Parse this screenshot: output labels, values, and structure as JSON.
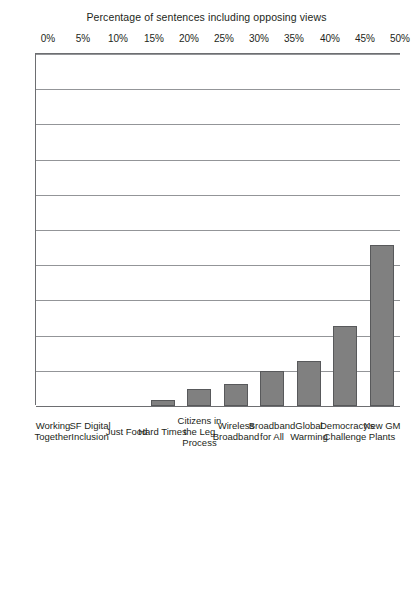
{
  "chart_data": {
    "type": "bar",
    "orientation": "horizontal",
    "title": "",
    "xlabel": "",
    "ylabel": "Percentage of sentences including opposing views",
    "ylim": [
      0,
      50
    ],
    "ytick_labels": [
      "0%",
      "5%",
      "10%",
      "15%",
      "20%",
      "25%",
      "30%",
      "35%",
      "40%",
      "45%",
      "50%"
    ],
    "ytick_values": [
      0,
      5,
      10,
      15,
      20,
      25,
      30,
      35,
      40,
      45,
      50
    ],
    "grid": true,
    "legend": "none",
    "categories": [
      "New GM Plants",
      "Democracy's Challenge",
      "Global Warming",
      "Broadband for All",
      "Wireless Broadband",
      "Citizens in the Leg Process",
      "Hard Times",
      "Just Food",
      "SF Digital Inclusion",
      "Working Together"
    ],
    "values": [
      22.9,
      11.4,
      6.4,
      5.0,
      3.1,
      2.4,
      0.9,
      0,
      0,
      0
    ],
    "bar_fill_color": "#808080",
    "bar_border_color": "#58595b",
    "gridline_color": "#939598",
    "axis_color": "#6d6e71",
    "text_color": "#231f20"
  }
}
